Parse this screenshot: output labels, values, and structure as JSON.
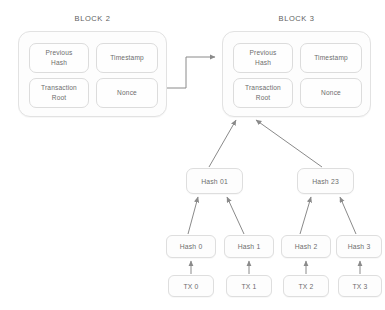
{
  "diagram": {
    "background_color": "#ffffff",
    "line_color": "#8c8c8c",
    "box_border_color": "#dedede"
  },
  "blocks": [
    {
      "id": "block-2",
      "title": "BLOCK 2",
      "x": 18,
      "y": 31,
      "w": 149,
      "h": 86,
      "fields": [
        {
          "name": "previous-hash",
          "label": "Previous\nHash",
          "x": 10,
          "y": 11,
          "w": 60,
          "h": 30
        },
        {
          "name": "timestamp",
          "label": "Timestamp",
          "x": 77,
          "y": 11,
          "w": 62,
          "h": 30
        },
        {
          "name": "transaction-root",
          "label": "Transaction\nRoot",
          "x": 10,
          "y": 46,
          "w": 60,
          "h": 30
        },
        {
          "name": "nonce",
          "label": "Nonce",
          "x": 77,
          "y": 46,
          "w": 62,
          "h": 30
        }
      ]
    },
    {
      "id": "block-3",
      "title": "BLOCK 3",
      "x": 222,
      "y": 31,
      "w": 149,
      "h": 86,
      "fields": [
        {
          "name": "previous-hash",
          "label": "Previous\nHash",
          "x": 10,
          "y": 11,
          "w": 60,
          "h": 30
        },
        {
          "name": "timestamp",
          "label": "Timestamp",
          "x": 77,
          "y": 11,
          "w": 62,
          "h": 30
        },
        {
          "name": "transaction-root",
          "label": "Transaction\nRoot",
          "x": 10,
          "y": 46,
          "w": 60,
          "h": 30
        },
        {
          "name": "nonce",
          "label": "Nonce",
          "x": 77,
          "y": 46,
          "w": 62,
          "h": 30
        }
      ]
    }
  ],
  "merkle": {
    "internal_nodes": [
      {
        "name": "hash-01",
        "label": "Hash 01",
        "x": 186,
        "y": 168,
        "w": 57,
        "h": 26
      },
      {
        "name": "hash-23",
        "label": "Hash 23",
        "x": 297,
        "y": 168,
        "w": 57,
        "h": 26
      }
    ],
    "hash_nodes": [
      {
        "name": "hash-0",
        "label": "Hash 0",
        "x": 166,
        "y": 235,
        "w": 50,
        "h": 23
      },
      {
        "name": "hash-1",
        "label": "Hash 1",
        "x": 224,
        "y": 235,
        "w": 50,
        "h": 23
      },
      {
        "name": "hash-2",
        "label": "Hash 2",
        "x": 281,
        "y": 235,
        "w": 50,
        "h": 23
      },
      {
        "name": "hash-3",
        "label": "Hash 3",
        "x": 336,
        "y": 235,
        "w": 46,
        "h": 23
      }
    ],
    "transactions": [
      {
        "name": "tx-0",
        "label": "TX 0",
        "x": 168,
        "y": 275,
        "w": 46,
        "h": 22
      },
      {
        "name": "tx-1",
        "label": "TX 1",
        "x": 226,
        "y": 275,
        "w": 46,
        "h": 22
      },
      {
        "name": "tx-2",
        "label": "TX 2",
        "x": 283,
        "y": 275,
        "w": 46,
        "h": 22
      },
      {
        "name": "tx-3",
        "label": "TX 3",
        "x": 338,
        "y": 275,
        "w": 44,
        "h": 22
      }
    ]
  },
  "connectors": [
    {
      "name": "block2-to-block3-chain-link",
      "type": "elbow"
    },
    {
      "name": "hash01-to-transaction-root",
      "type": "arrow"
    },
    {
      "name": "hash23-to-transaction-root",
      "type": "arrow"
    },
    {
      "name": "hash0-to-hash01",
      "type": "arrow"
    },
    {
      "name": "hash1-to-hash01",
      "type": "arrow"
    },
    {
      "name": "hash2-to-hash23",
      "type": "arrow"
    },
    {
      "name": "hash3-to-hash23",
      "type": "arrow"
    },
    {
      "name": "tx0-to-hash0",
      "type": "arrow"
    },
    {
      "name": "tx1-to-hash1",
      "type": "arrow"
    },
    {
      "name": "tx2-to-hash2",
      "type": "arrow"
    },
    {
      "name": "tx3-to-hash3",
      "type": "arrow"
    }
  ]
}
